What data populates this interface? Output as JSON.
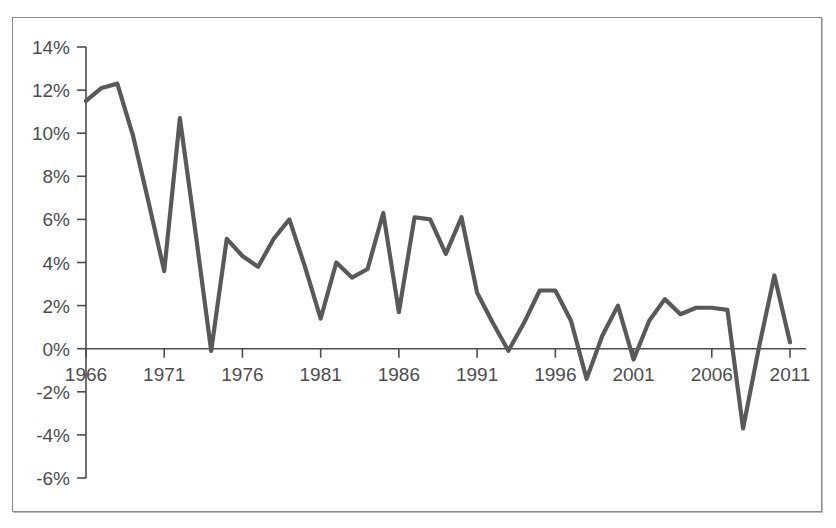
{
  "chart_data": {
    "type": "line",
    "title": "",
    "xlabel": "",
    "ylabel": "",
    "xlim": [
      1966,
      2011
    ],
    "ylim": [
      -6,
      14
    ],
    "ytick_step": 2,
    "grid": false,
    "legend": null,
    "y_tick_labels": [
      "14%",
      "12%",
      "10%",
      "8%",
      "6%",
      "4%",
      "2%",
      "0%",
      "-2%",
      "-4%",
      "-6%"
    ],
    "y_tick_values": [
      14,
      12,
      10,
      8,
      6,
      4,
      2,
      0,
      -2,
      -4,
      -6
    ],
    "x_tick_labels": [
      "1966",
      "1971",
      "1976",
      "1981",
      "1986",
      "1991",
      "1996",
      "2001",
      "2006",
      "2011"
    ],
    "x_tick_values": [
      1966,
      1971,
      1976,
      1981,
      1986,
      1991,
      1996,
      2001,
      2006,
      2011
    ],
    "series_name": "",
    "line_color": "#595959",
    "x": [
      1966,
      1967,
      1968,
      1969,
      1970,
      1971,
      1972,
      1973,
      1974,
      1975,
      1976,
      1977,
      1978,
      1979,
      1980,
      1981,
      1982,
      1983,
      1984,
      1985,
      1986,
      1987,
      1988,
      1989,
      1990,
      1991,
      1992,
      1993,
      1994,
      1995,
      1996,
      1997,
      1998,
      1999,
      2000,
      2001,
      2002,
      2003,
      2004,
      2005,
      2006,
      2007,
      2008,
      2009,
      2010,
      2011
    ],
    "values": [
      11.5,
      12.1,
      12.3,
      9.9,
      6.8,
      3.6,
      10.7,
      5.4,
      -0.1,
      5.1,
      4.3,
      3.8,
      5.1,
      6.0,
      3.8,
      1.4,
      4.0,
      3.3,
      3.7,
      6.3,
      1.7,
      6.1,
      6.0,
      4.4,
      6.1,
      2.6,
      1.2,
      -0.1,
      1.2,
      2.7,
      2.7,
      1.3,
      -1.4,
      0.6,
      2.0,
      -0.5,
      1.3,
      2.3,
      1.6,
      1.9,
      1.9,
      1.8,
      -3.7,
      0.0,
      3.4,
      0.3
    ]
  },
  "axis_labels": {
    "y": [
      "14%",
      "12%",
      "10%",
      "8%",
      "6%",
      "4%",
      "2%",
      "0%",
      "-2%",
      "-4%",
      "-6%"
    ],
    "x": [
      "1966",
      "1971",
      "1976",
      "1981",
      "1986",
      "1991",
      "1996",
      "2001",
      "2006",
      "2011"
    ]
  }
}
